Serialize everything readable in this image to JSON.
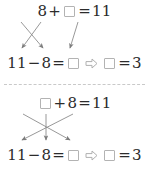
{
  "page": {
    "background_color": "#ffffff",
    "text_color": "#2b2b2b",
    "box_border_color": "#b3b3b3",
    "arrow_color": "#8c8c8c",
    "divider_color": "#c9c9c9",
    "divider_style": "dashed"
  },
  "blocks": [
    {
      "id": "block-1",
      "top_equation": {
        "tokens": [
          "8",
          "+",
          "box",
          "=",
          "11"
        ],
        "text": "8+□=11",
        "addend_1": "8",
        "operator_1": "+",
        "addend_2": "",
        "equals": "=",
        "sum": "11"
      },
      "bottom_equation": {
        "text": "11−8=□ ⇨ □=3",
        "minuend": "11",
        "operator": "−",
        "subtrahend": "8",
        "equals_1": "=",
        "difference": "",
        "implies": "⇨",
        "answer_label": "",
        "equals_2": "=",
        "answer_value": "3"
      },
      "arrows": [
        {
          "name": "arrow-8-to-subtrahend",
          "from": "8",
          "to": "difference-left",
          "x1": 21,
          "y1": 22,
          "x2": 43,
          "y2": 50
        },
        {
          "name": "arrow-box-to-minuend",
          "from": "box",
          "to": "minuend",
          "x1": 41,
          "y1": 22,
          "x2": 22,
          "y2": 50
        },
        {
          "name": "arrow-11-to-subtrahend",
          "from": "11",
          "to": "subtrahend",
          "x1": 77,
          "y1": 22,
          "x2": 70,
          "y2": 50
        }
      ]
    },
    {
      "id": "block-2",
      "top_equation": {
        "tokens": [
          "box",
          "+",
          "8",
          "=",
          "11"
        ],
        "text": "□+8=11",
        "addend_1": "",
        "operator_1": "+",
        "addend_2": "8",
        "equals": "=",
        "sum": "11"
      },
      "bottom_equation": {
        "text": "11−8=□ ⇨ □=3",
        "minuend": "11",
        "operator": "−",
        "subtrahend": "8",
        "equals_1": "=",
        "difference": "",
        "implies": "⇨",
        "answer_label": "",
        "equals_2": "=",
        "answer_value": "3"
      },
      "arrows": [
        {
          "name": "arrow-box-to-difference",
          "from": "box",
          "to": "difference",
          "x1": 22,
          "y1": 24,
          "x2": 70,
          "y2": 52
        },
        {
          "name": "arrow-8-down",
          "from": "8",
          "to": "subtrahend",
          "x1": 46,
          "y1": 24,
          "x2": 46,
          "y2": 52
        },
        {
          "name": "arrow-11-to-minuend",
          "from": "11",
          "to": "minuend",
          "x1": 72,
          "y1": 24,
          "x2": 22,
          "y2": 52
        }
      ]
    }
  ]
}
